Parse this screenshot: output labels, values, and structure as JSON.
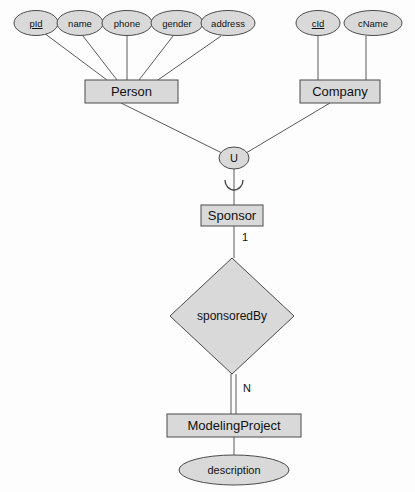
{
  "diagram": {
    "type": "entity-relationship-diagram",
    "colors": {
      "fill": "#d9d9d9",
      "stroke": "#4a4a4a",
      "line": "#5a5a5a",
      "text": "#111111",
      "background": "#fdfdfd"
    },
    "person_attributes": [
      {
        "label": "pId",
        "is_key": true,
        "cx": 36,
        "cy": 23,
        "rx": 22,
        "ry": 12.5
      },
      {
        "label": "name",
        "is_key": false,
        "cx": 80,
        "cy": 23,
        "rx": 23,
        "ry": 12.5
      },
      {
        "label": "phone",
        "is_key": false,
        "cx": 127,
        "cy": 23,
        "rx": 25,
        "ry": 12.5
      },
      {
        "label": "gender",
        "is_key": false,
        "cx": 177,
        "cy": 23,
        "rx": 26,
        "ry": 12.5
      },
      {
        "label": "address",
        "is_key": false,
        "cx": 228,
        "cy": 23,
        "rx": 27,
        "ry": 12.5
      }
    ],
    "company_attributes": [
      {
        "label": "cId",
        "is_key": true,
        "cx": 318,
        "cy": 23,
        "rx": 22,
        "ry": 12.5
      },
      {
        "label": "cName",
        "is_key": false,
        "cx": 373,
        "cy": 23,
        "rx": 29,
        "ry": 12.5
      }
    ],
    "entities": [
      {
        "label": "Person",
        "x": 85,
        "y": 80,
        "w": 93,
        "h": 23,
        "weak": false
      },
      {
        "label": "Company",
        "x": 300,
        "y": 80,
        "w": 80,
        "h": 23,
        "weak": false
      },
      {
        "label": "Sponsor",
        "x": 201,
        "y": 205,
        "w": 62,
        "h": 21,
        "weak": false
      },
      {
        "label": "ModelingProject",
        "x": 167,
        "y": 414,
        "w": 134,
        "h": 23,
        "weak": false
      }
    ],
    "union_node": {
      "label": "U",
      "cx": 234,
      "cy": 158,
      "rx": 15,
      "ry": 11
    },
    "relationship": {
      "label": "sponsoredBy",
      "cx": 232,
      "cy": 316,
      "half_w": 62,
      "half_h": 58
    },
    "project_attributes": [
      {
        "label": "description",
        "is_key": false,
        "cx": 234,
        "cy": 470,
        "rx": 55,
        "ry": 15
      }
    ],
    "cardinalities": [
      {
        "label": "1",
        "x": 243,
        "y": 236
      },
      {
        "label": "N",
        "x": 246,
        "y": 388
      }
    ]
  }
}
